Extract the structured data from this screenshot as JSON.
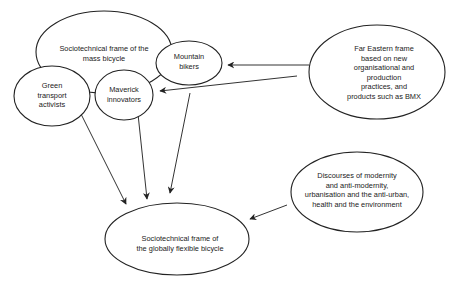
{
  "diagram": {
    "nodes": [
      {
        "id": "mass",
        "label": "Sociotechnical frame of the\nmass bicycle",
        "cx": 104,
        "cy": 52,
        "rx": 68,
        "ry": 41,
        "tx": 104,
        "ty": 53
      },
      {
        "id": "mountain",
        "label": "Mountain\nbikers",
        "cx": 189,
        "cy": 63,
        "rx": 33,
        "ry": 22,
        "tx": 189,
        "ty": 61
      },
      {
        "id": "green",
        "label": "Green\ntransport\nactivists",
        "cx": 52,
        "cy": 96,
        "rx": 38,
        "ry": 30,
        "tx": 52,
        "ty": 95
      },
      {
        "id": "maverick",
        "label": "Maverick\ninnovators",
        "cx": 124,
        "cy": 95,
        "rx": 29,
        "ry": 25,
        "tx": 124,
        "ty": 94
      },
      {
        "id": "fareast",
        "label": "Far Eastern frame\nbased on new\norganisational and production\npractices, and\nproducts such as BMX",
        "cx": 377,
        "cy": 72,
        "rx": 68,
        "ry": 47,
        "tx": 384,
        "ty": 72
      },
      {
        "id": "discourses",
        "label": "Discourses of modernity\nand anti-modernity,\nurbanisation and the anti-urban,\nhealth and the environment",
        "cx": 357,
        "cy": 192,
        "rx": 66,
        "ry": 40,
        "tx": 357,
        "ty": 190
      },
      {
        "id": "flexible",
        "label": "Sociotechnical frame of\nthe globally flexible bicycle",
        "cx": 177,
        "cy": 239,
        "rx": 72,
        "ry": 36,
        "tx": 180,
        "ty": 243
      }
    ],
    "edges": [
      {
        "from": "fareast",
        "to": "mountain",
        "x1": 309,
        "y1": 65,
        "x2": 228,
        "y2": 65
      },
      {
        "from": "fareast",
        "to": "maverick",
        "x1": 297,
        "y1": 76,
        "x2": 160,
        "y2": 91
      },
      {
        "from": "green",
        "to": "flexible",
        "x1": 80,
        "y1": 112,
        "x2": 126,
        "y2": 204
      },
      {
        "from": "maverick",
        "to": "flexible",
        "x1": 138,
        "y1": 114,
        "x2": 147,
        "y2": 199
      },
      {
        "from": "mountain",
        "to": "flexible",
        "x1": 190,
        "y1": 93,
        "x2": 170,
        "y2": 193
      },
      {
        "from": "discourses",
        "to": "flexible",
        "x1": 287,
        "y1": 205,
        "x2": 250,
        "y2": 219
      }
    ]
  }
}
